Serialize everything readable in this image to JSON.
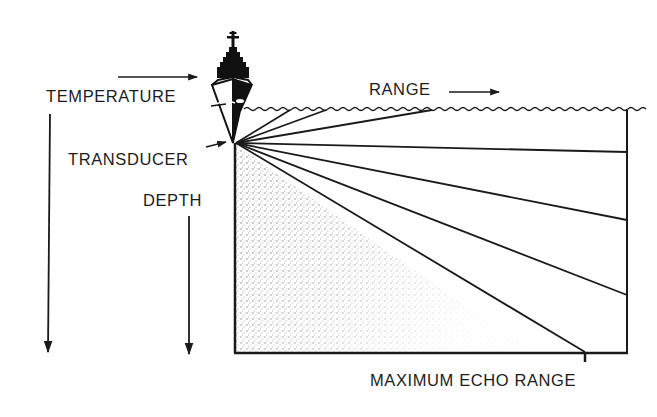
{
  "diagram": {
    "labels": {
      "temperature": "TEMPERATURE",
      "range": "RANGE",
      "transducer": "TRANSDUCER",
      "depth": "DEPTH",
      "max_echo_range": "MAXIMUM ECHO RANGE"
    },
    "arrows": {
      "temperature": "right",
      "range": "right",
      "depth_left": "down",
      "depth_inner": "down",
      "transducer": "pointer"
    },
    "elements": {
      "ship": "ship-bow-icon",
      "sea_surface": "wavy-line",
      "shadow_zone": "stippled-region",
      "sound_rays": 7
    },
    "colors": {
      "ink": "#1a1a1a",
      "background": "#ffffff",
      "stipple": "#9a9a9a"
    }
  }
}
